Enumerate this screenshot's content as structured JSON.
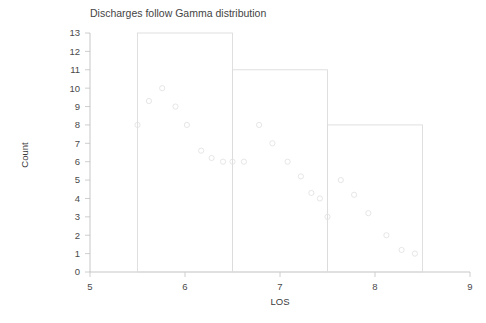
{
  "chart_data": {
    "type": "bar",
    "title": "Discharges follow Gamma distribution",
    "xlabel": "LOS",
    "ylabel": "Count",
    "xlim": [
      5,
      9
    ],
    "ylim": [
      0,
      13
    ],
    "grid": false,
    "legend": null,
    "xticks": [
      5,
      6,
      7,
      8,
      9
    ],
    "xtick_labels": [
      "5",
      "6",
      "7",
      "8",
      "9"
    ],
    "yticks": [
      0,
      1,
      2,
      3,
      4,
      5,
      6,
      7,
      8,
      9,
      10,
      11,
      12,
      13
    ],
    "ytick_labels": [
      "0",
      "1",
      "2",
      "3",
      "4",
      "5",
      "6",
      "7",
      "8",
      "9",
      "10",
      "11",
      "12",
      "13"
    ],
    "histogram": {
      "style": "outline",
      "bin_edges": [
        5.5,
        6.5,
        7.5,
        8.5
      ],
      "bins": [
        {
          "x0": 5.5,
          "x1": 6.5,
          "count": 13
        },
        {
          "x0": 6.5,
          "x1": 7.5,
          "count": 11
        },
        {
          "x0": 7.5,
          "x1": 8.5,
          "count": 8
        }
      ]
    },
    "scatter": {
      "marker": "open-circle",
      "points": [
        {
          "x": 5.5,
          "y": 8.0
        },
        {
          "x": 5.62,
          "y": 9.3
        },
        {
          "x": 5.76,
          "y": 10.0
        },
        {
          "x": 5.9,
          "y": 9.0
        },
        {
          "x": 6.02,
          "y": 8.0
        },
        {
          "x": 6.17,
          "y": 6.6
        },
        {
          "x": 6.28,
          "y": 6.2
        },
        {
          "x": 6.4,
          "y": 6.0
        },
        {
          "x": 6.5,
          "y": 6.0
        },
        {
          "x": 6.62,
          "y": 6.0
        },
        {
          "x": 6.78,
          "y": 8.0
        },
        {
          "x": 6.92,
          "y": 7.0
        },
        {
          "x": 7.08,
          "y": 6.0
        },
        {
          "x": 7.22,
          "y": 5.2
        },
        {
          "x": 7.33,
          "y": 4.3
        },
        {
          "x": 7.42,
          "y": 4.0
        },
        {
          "x": 7.5,
          "y": 3.0
        },
        {
          "x": 7.64,
          "y": 5.0
        },
        {
          "x": 7.78,
          "y": 4.2
        },
        {
          "x": 7.93,
          "y": 3.2
        },
        {
          "x": 8.12,
          "y": 2.0
        },
        {
          "x": 8.28,
          "y": 1.2
        },
        {
          "x": 8.42,
          "y": 1.0
        }
      ]
    }
  },
  "colors": {
    "background": "#ffffff",
    "axis": "#b9b9b9",
    "bar_stroke": "#dcdcdc",
    "point_stroke": "#e2e2e2",
    "text": "#3a3a3a"
  }
}
